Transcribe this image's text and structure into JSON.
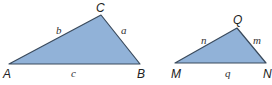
{
  "colors": {
    "fill": "#91b2d8",
    "stroke": "#3a4a5c",
    "text": "#222222"
  },
  "triangles": [
    {
      "id": "ABC",
      "vertices": [
        {
          "label": "A",
          "x": 9,
          "y": 64
        },
        {
          "label": "B",
          "x": 140,
          "y": 64
        },
        {
          "label": "C",
          "x": 101,
          "y": 15
        }
      ],
      "sides": [
        {
          "label": "a",
          "between": "B-C"
        },
        {
          "label": "b",
          "between": "A-C"
        },
        {
          "label": "c",
          "between": "A-B"
        }
      ]
    },
    {
      "id": "MNQ",
      "vertices": [
        {
          "label": "M",
          "x": 175,
          "y": 63
        },
        {
          "label": "N",
          "x": 266,
          "y": 63
        },
        {
          "label": "Q",
          "x": 237,
          "y": 28
        }
      ],
      "sides": [
        {
          "label": "m",
          "between": "N-Q"
        },
        {
          "label": "n",
          "between": "M-Q"
        },
        {
          "label": "q",
          "between": "M-N"
        }
      ]
    }
  ]
}
